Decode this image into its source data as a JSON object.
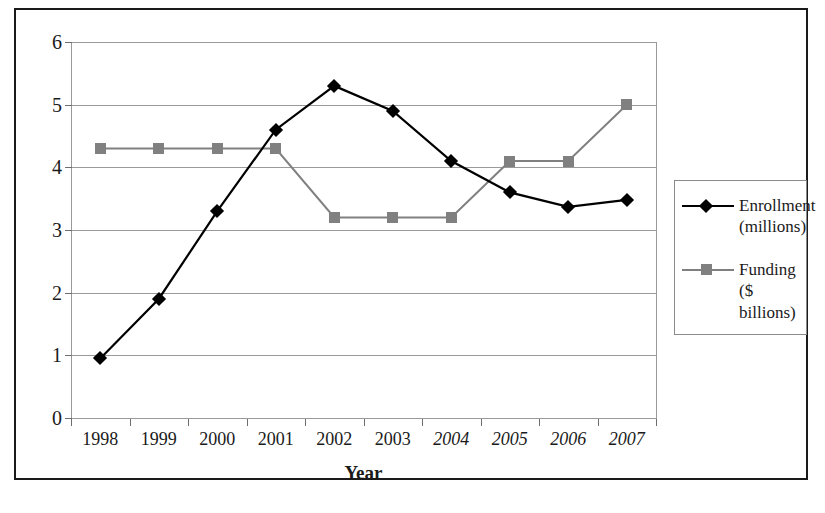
{
  "chart_data": {
    "type": "line",
    "title": "",
    "xlabel": "Year",
    "ylabel": "",
    "categories": [
      "1998",
      "1999",
      "2000",
      "2001",
      "2002",
      "2003",
      "2004",
      "2005",
      "2006",
      "2007"
    ],
    "projected_categories": [
      "2004",
      "2005",
      "2006",
      "2007"
    ],
    "series": [
      {
        "name": "Enrollment",
        "unit": "(millions)",
        "marker": "diamond",
        "color": "#000000",
        "values": [
          0.95,
          1.9,
          3.3,
          4.6,
          5.3,
          4.9,
          4.1,
          3.6,
          3.37,
          3.48
        ]
      },
      {
        "name": "Funding",
        "unit": "($ billions)",
        "marker": "square",
        "color": "#808080",
        "values": [
          4.3,
          4.3,
          4.3,
          4.3,
          3.2,
          3.2,
          3.2,
          4.1,
          4.1,
          5.0
        ]
      }
    ],
    "ylim": [
      0,
      6
    ],
    "y_ticks": [
      "0",
      "1",
      "2",
      "3",
      "4",
      "5",
      "6"
    ],
    "grid": true,
    "legend_position": "right"
  },
  "axis": {
    "x_title": "Year",
    "y_tick_labels": [
      "6",
      "5",
      "4",
      "3",
      "2",
      "1",
      "0"
    ],
    "x_tick_labels": [
      "1998",
      "1999",
      "2000",
      "2001",
      "2002",
      "2003",
      "2004",
      "2005",
      "2006",
      "2007"
    ]
  },
  "legend": {
    "entries": [
      {
        "line1": "Enrollment",
        "line2": "(millions)"
      },
      {
        "line1": "Funding",
        "line2": "($ billions)"
      }
    ]
  },
  "colors": {
    "enrollment": "#000000",
    "funding": "#808080",
    "grid": "#9a9a9a",
    "frame": "#1a1a1a",
    "background": "#ffffff"
  }
}
